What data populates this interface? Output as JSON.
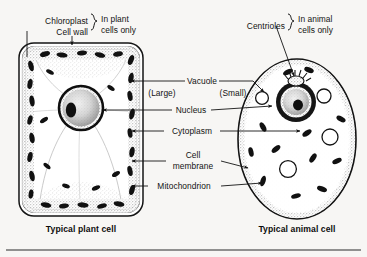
{
  "figure": {
    "background_color": "#f7f6f4",
    "ink_color": "#141414",
    "type": "biology-diagram"
  },
  "plant_cell": {
    "caption": "Typical plant cell",
    "exclusive_note": "In plant\ncells only",
    "exclusive_note_line1": "In plant",
    "exclusive_note_line2": "cells only",
    "labels": {
      "chloroplast": "Chloroplast",
      "cell_wall": "Cell wall"
    },
    "vacuole_qualifier": "(Large)"
  },
  "animal_cell": {
    "caption": "Typical animal cell",
    "exclusive_note_line1": "In animal",
    "exclusive_note_line2": "cells only",
    "labels": {
      "centrioles": "Centrioles"
    },
    "vacuole_qualifier": "(Small)"
  },
  "shared_labels": {
    "vacuole": "Vacuole",
    "nucleus": "Nucleus",
    "cytoplasm": "Cytoplasm",
    "cell_membrane_line1": "Cell",
    "cell_membrane_line2": "membrane",
    "cell_membrane": "Cell membrane",
    "mitochondrion": "Mitochondrion"
  }
}
